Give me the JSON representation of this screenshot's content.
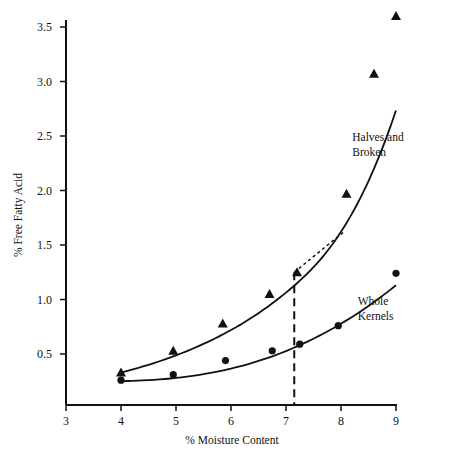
{
  "chart_data": {
    "type": "line",
    "title": "",
    "xlabel": "% Moisture Content",
    "ylabel": "% Free Fatty Acid",
    "xlim": [
      3,
      9
    ],
    "ylim": [
      0,
      3.5
    ],
    "x_ticks": [
      3,
      4,
      5,
      6,
      7,
      8,
      9
    ],
    "x_tick_labels": [
      "3",
      "4",
      "5",
      "6",
      "7",
      "8",
      "9"
    ],
    "y_ticks": [
      0.5,
      1.0,
      1.5,
      2.0,
      2.5,
      3.0,
      3.5
    ],
    "y_tick_labels": [
      "0.5",
      "1.0",
      "1.5",
      "2.0",
      "2.5",
      "3.0",
      "3.5"
    ],
    "grid": false,
    "legend": "none (inline curve labels)",
    "series": [
      {
        "name": "Halves and Broken",
        "marker": "triangle",
        "x": [
          4.0,
          4.95,
          5.85,
          6.7,
          7.2,
          8.1,
          8.6,
          9.0
        ],
        "y": [
          0.33,
          0.53,
          0.78,
          1.05,
          1.25,
          1.97,
          3.07,
          3.6
        ]
      },
      {
        "name": "Whole Kernels",
        "marker": "circle",
        "x": [
          4.0,
          4.95,
          5.9,
          6.75,
          7.25,
          7.95,
          9.0
        ],
        "y": [
          0.26,
          0.31,
          0.44,
          0.53,
          0.59,
          0.76,
          1.24
        ]
      }
    ],
    "annotations": [
      {
        "type": "label",
        "text_lines": [
          "Halves and",
          "Broken"
        ],
        "x": 8.75,
        "y": 2.45
      },
      {
        "type": "label",
        "text_lines": [
          "Whole",
          "Kernels"
        ],
        "x": 8.85,
        "y": 0.95
      },
      {
        "type": "vertical-dashed-line",
        "x": 7.15,
        "y_from": 0,
        "y_to": 1.25
      },
      {
        "type": "tangent-dotted-line",
        "x_from": 7.15,
        "y_from": 1.25,
        "x_to": 8.05,
        "y_to": 1.62
      }
    ]
  }
}
